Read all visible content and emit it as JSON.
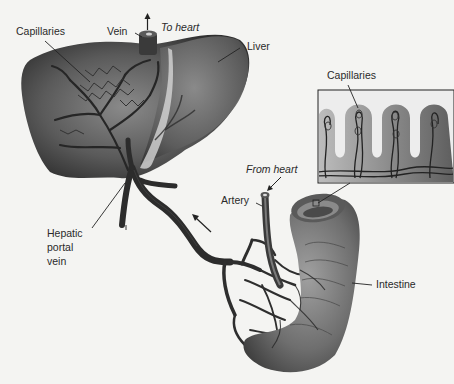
{
  "diagram": {
    "type": "anatomical-illustration",
    "colors": {
      "background": "#f4f4f2",
      "organ_dark": "#3c3c3c",
      "organ_mid": "#6e6e6e",
      "organ_light": "#a8a8a8",
      "vessel": "#2e2e2e",
      "text": "#2a2a2a"
    },
    "labels": {
      "capillaries_liver": "Capillaries",
      "vein": "Vein",
      "to_heart": "To heart",
      "liver": "Liver",
      "capillaries_inset": "Capillaries",
      "from_heart": "From heart",
      "artery": "Artery",
      "hepatic_portal_vein": "Hepatic\nportal\nvein",
      "intestine": "Intestine"
    },
    "arrows": [
      {
        "name": "to-heart-arrow",
        "direction": "up"
      },
      {
        "name": "portal-flow-arrow",
        "direction": "up-left"
      }
    ],
    "inset": {
      "name": "intestinal-villi-inset",
      "shows": "capillaries within villi"
    }
  }
}
